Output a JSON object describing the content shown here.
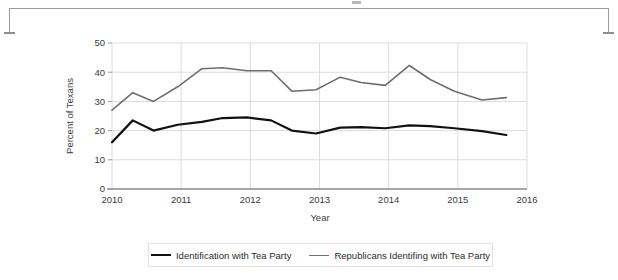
{
  "frame": {
    "bracket_name": "top-bracket-rule"
  },
  "chart_data": {
    "type": "line",
    "title": "",
    "xlabel": "Year",
    "ylabel": "Percent of Texans",
    "xlim": [
      2010,
      2016
    ],
    "ylim": [
      0,
      50
    ],
    "grid": true,
    "legend_position": "bottom",
    "xticks": [
      "2010",
      "2011",
      "2012",
      "2013",
      "2014",
      "2015",
      "2016"
    ],
    "yticks": [
      "0",
      "10",
      "20",
      "30",
      "40",
      "50"
    ],
    "x": [
      2010.0,
      2010.3,
      2010.6,
      2010.95,
      2011.3,
      2011.6,
      2011.95,
      2012.3,
      2012.6,
      2012.95,
      2013.3,
      2013.6,
      2013.95,
      2014.3,
      2014.6,
      2014.95,
      2015.35,
      2015.7
    ],
    "series": [
      {
        "name": "Identification with Tea Party",
        "color": "#111111",
        "width": 2.2,
        "values": [
          16.0,
          23.5,
          20.0,
          22.0,
          23.0,
          24.3,
          24.5,
          23.5,
          20.0,
          19.0,
          21.0,
          21.2,
          20.8,
          21.8,
          21.5,
          20.8,
          19.8,
          18.5
        ]
      },
      {
        "name": "Republicans Identifing with Tea Party",
        "color": "#6e6e6e",
        "width": 1.6,
        "values": [
          27.0,
          33.0,
          30.0,
          35.0,
          41.2,
          41.5,
          40.5,
          40.5,
          33.5,
          34.0,
          38.3,
          36.5,
          35.5,
          42.3,
          37.5,
          33.5,
          30.5,
          31.3
        ]
      }
    ]
  },
  "legend": {
    "items": [
      {
        "label": "Identification with Tea Party"
      },
      {
        "label": "Republicans Identifing with Tea Party"
      }
    ]
  }
}
